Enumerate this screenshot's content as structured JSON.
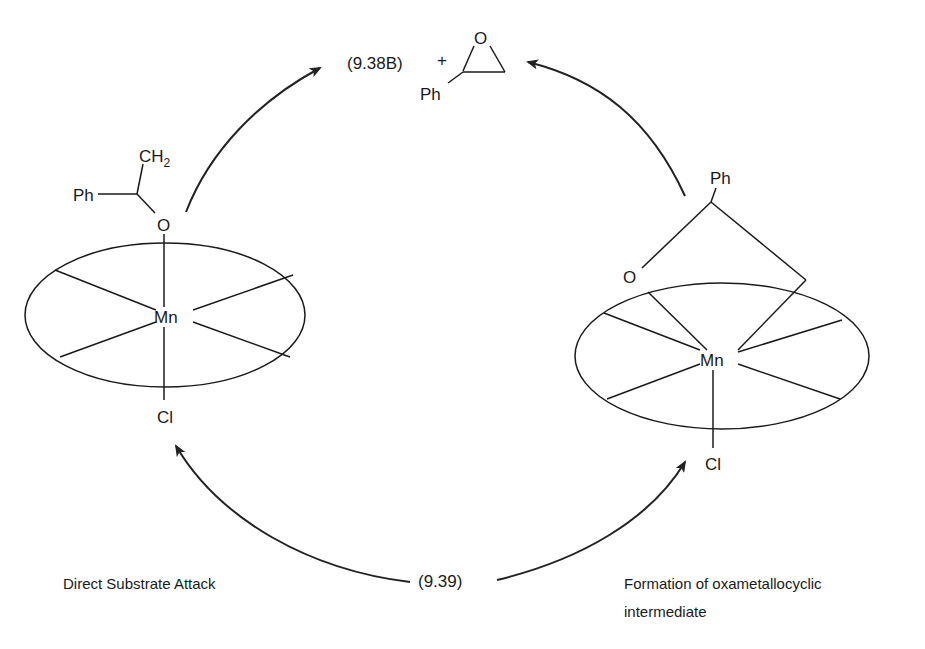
{
  "diagram": {
    "type": "catalytic cycle",
    "colors": {
      "ink": "#1a1a1a",
      "background": "#ffffff"
    },
    "top": {
      "label_compound": "(9.38B)",
      "plus": "+",
      "epoxide": {
        "ring_atom": "O",
        "substituent": "Ph"
      }
    },
    "left_complex": {
      "metal": "Mn",
      "axial_bottom": "Cl",
      "axial_top": "O",
      "substituent_ch2": "CH",
      "substituent_ch2_sub": "2",
      "substituent_ph": "Ph"
    },
    "right_complex": {
      "metal": "Mn",
      "axial_bottom": "Cl",
      "ring_oxygen": "O",
      "substituent_ph": "Ph"
    },
    "bottom": {
      "start_compound": "(9.39)",
      "left_pathway": "Direct Substrate Attack",
      "right_pathway_line1": "Formation of oxametallocyclic",
      "right_pathway_line2": "intermediate"
    }
  }
}
